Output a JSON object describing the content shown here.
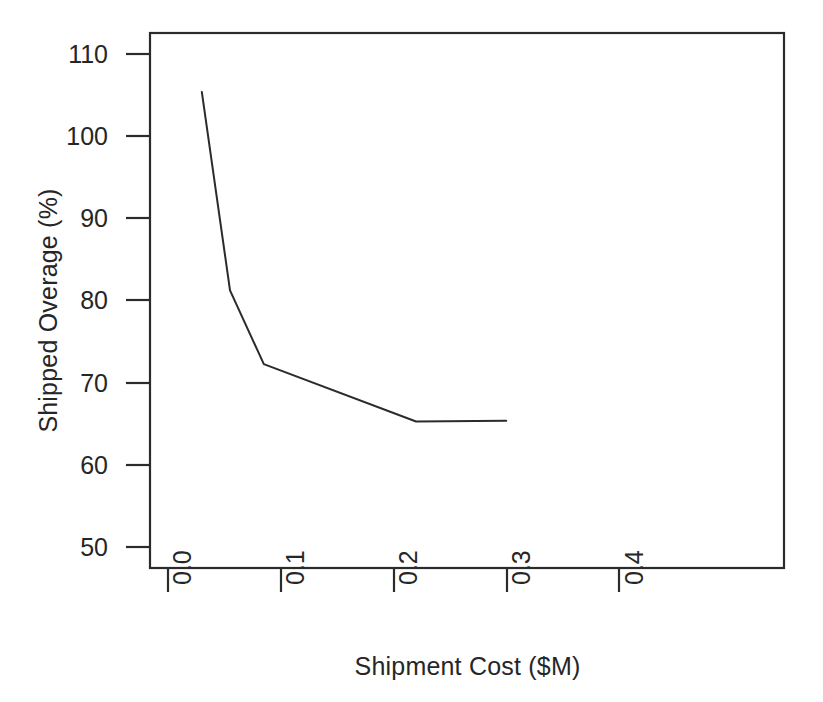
{
  "chart_data": {
    "type": "line",
    "title": "",
    "xlabel": "Shipment Cost ($M)",
    "ylabel": "Shipped Overage (%)",
    "xlim": [
      0.0,
      0.4
    ],
    "ylim": [
      48.0,
      113.0
    ],
    "xticks": [
      "0.0",
      "0.1",
      "0.2",
      "0.3",
      "0.4"
    ],
    "xtick_values": [
      0.0,
      0.1,
      0.2,
      0.3,
      0.4
    ],
    "yticks": [
      "110",
      "100",
      "90",
      "80",
      "70",
      "60",
      "50"
    ],
    "ytick_values": [
      110,
      100,
      90,
      80,
      70,
      60,
      50
    ],
    "grid": false,
    "legend": false,
    "legend_position": "none",
    "series": [
      {
        "name": "Shipped Overage",
        "color": "#2b2b2b",
        "line_width": 2,
        "markers": false,
        "x": [
          0.03,
          0.055,
          0.085,
          0.22,
          0.3
        ],
        "y": [
          105.5,
          81.3,
          72.3,
          65.3,
          65.4
        ]
      }
    ],
    "annotations": []
  },
  "axes": {
    "frame_color": "#2b2b2b",
    "tick_color": "#2b2b2b",
    "background": "#ffffff"
  }
}
